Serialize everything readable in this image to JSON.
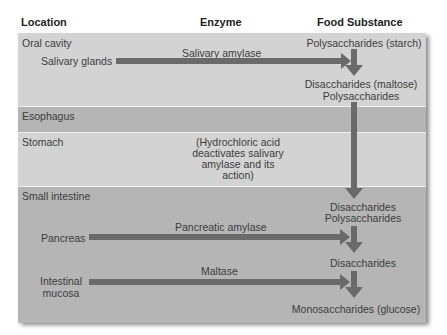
{
  "headers": {
    "location": "Location",
    "enzyme": "Enzyme",
    "food_substance": "Food Substance"
  },
  "rows": {
    "oral_cavity": {
      "label": "Oral cavity",
      "source": "Salivary glands",
      "enzyme": "Salivary amylase",
      "substance_top": "Polysaccharides (starch)",
      "substance_bottom_1": "Disaccharides (maltose)",
      "substance_bottom_2": "Polysaccharides"
    },
    "esophagus": {
      "label": "Esophagus"
    },
    "stomach": {
      "label": "Stomach",
      "note_1": "(Hydrochloric acid",
      "note_2": "deactivates salivary",
      "note_3": "amylase and its",
      "note_4": "action)"
    },
    "small_intestine": {
      "label": "Small intestine",
      "substance_1a": "Disaccharides",
      "substance_1b": "Polysaccharides",
      "pancreas": {
        "source": "Pancreas",
        "enzyme": "Pancreatic amylase"
      },
      "substance_2": "Disaccharides",
      "mucosa": {
        "source_1": "Intestinal",
        "source_2": "mucosa",
        "enzyme": "Maltase"
      },
      "substance_3": "Monosaccharides (glucose)"
    }
  },
  "colors": {
    "light_row": "#d3d3d3",
    "dark_row": "#b5b5b5",
    "arrow": "#6a6a6a"
  }
}
